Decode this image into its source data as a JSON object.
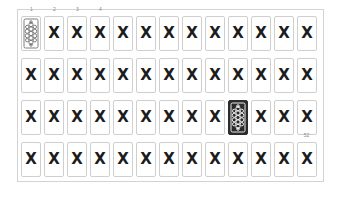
{
  "figure": {
    "name": "playing-card-deck-grid",
    "rows": 4,
    "columns": 13,
    "total_cards": 52,
    "colors": {
      "card_border": "#cfcfcf",
      "frame_border": "#d3d3d3",
      "mark_color": "#1c1c1c",
      "highlight_background": "#2b2b2b",
      "highlight_ornament": "#ffffff",
      "index_label_color": "#8a8a8a",
      "page_background": "#ffffff"
    },
    "mark_label": "X",
    "index_labels": {
      "1": "1",
      "2": "2",
      "3": "3",
      "4": "4",
      "52": "52"
    },
    "grid": [
      [
        {
          "index": 1,
          "state": "back",
          "label": "",
          "index_label": "1"
        },
        {
          "index": 2,
          "state": "marked",
          "label": "X",
          "index_label": "2"
        },
        {
          "index": 3,
          "state": "marked",
          "label": "X",
          "index_label": "3"
        },
        {
          "index": 4,
          "state": "marked",
          "label": "X",
          "index_label": "4"
        },
        {
          "index": 5,
          "state": "marked",
          "label": "X",
          "index_label": ""
        },
        {
          "index": 6,
          "state": "marked",
          "label": "X",
          "index_label": ""
        },
        {
          "index": 7,
          "state": "marked",
          "label": "X",
          "index_label": ""
        },
        {
          "index": 8,
          "state": "marked",
          "label": "X",
          "index_label": ""
        },
        {
          "index": 9,
          "state": "marked",
          "label": "X",
          "index_label": ""
        },
        {
          "index": 10,
          "state": "marked",
          "label": "X",
          "index_label": ""
        },
        {
          "index": 11,
          "state": "marked",
          "label": "X",
          "index_label": ""
        },
        {
          "index": 12,
          "state": "marked",
          "label": "X",
          "index_label": ""
        },
        {
          "index": 13,
          "state": "marked",
          "label": "X",
          "index_label": ""
        }
      ],
      [
        {
          "index": 14,
          "state": "marked",
          "label": "X",
          "index_label": ""
        },
        {
          "index": 15,
          "state": "marked",
          "label": "X",
          "index_label": ""
        },
        {
          "index": 16,
          "state": "marked",
          "label": "X",
          "index_label": ""
        },
        {
          "index": 17,
          "state": "marked",
          "label": "X",
          "index_label": ""
        },
        {
          "index": 18,
          "state": "marked",
          "label": "X",
          "index_label": ""
        },
        {
          "index": 19,
          "state": "marked",
          "label": "X",
          "index_label": ""
        },
        {
          "index": 20,
          "state": "marked",
          "label": "X",
          "index_label": ""
        },
        {
          "index": 21,
          "state": "marked",
          "label": "X",
          "index_label": ""
        },
        {
          "index": 22,
          "state": "marked",
          "label": "X",
          "index_label": ""
        },
        {
          "index": 23,
          "state": "marked",
          "label": "X",
          "index_label": ""
        },
        {
          "index": 24,
          "state": "marked",
          "label": "X",
          "index_label": ""
        },
        {
          "index": 25,
          "state": "marked",
          "label": "X",
          "index_label": ""
        },
        {
          "index": 26,
          "state": "marked",
          "label": "X",
          "index_label": ""
        }
      ],
      [
        {
          "index": 27,
          "state": "marked",
          "label": "X",
          "index_label": ""
        },
        {
          "index": 28,
          "state": "marked",
          "label": "X",
          "index_label": ""
        },
        {
          "index": 29,
          "state": "marked",
          "label": "X",
          "index_label": ""
        },
        {
          "index": 30,
          "state": "marked",
          "label": "X",
          "index_label": ""
        },
        {
          "index": 31,
          "state": "marked",
          "label": "X",
          "index_label": ""
        },
        {
          "index": 32,
          "state": "marked",
          "label": "X",
          "index_label": ""
        },
        {
          "index": 33,
          "state": "marked",
          "label": "X",
          "index_label": ""
        },
        {
          "index": 34,
          "state": "marked",
          "label": "X",
          "index_label": ""
        },
        {
          "index": 35,
          "state": "marked",
          "label": "X",
          "index_label": ""
        },
        {
          "index": 36,
          "state": "highlight",
          "label": "",
          "index_label": ""
        },
        {
          "index": 37,
          "state": "marked",
          "label": "X",
          "index_label": ""
        },
        {
          "index": 38,
          "state": "marked",
          "label": "X",
          "index_label": ""
        },
        {
          "index": 39,
          "state": "marked",
          "label": "X",
          "index_label": ""
        }
      ],
      [
        {
          "index": 40,
          "state": "marked",
          "label": "X",
          "index_label": ""
        },
        {
          "index": 41,
          "state": "marked",
          "label": "X",
          "index_label": ""
        },
        {
          "index": 42,
          "state": "marked",
          "label": "X",
          "index_label": ""
        },
        {
          "index": 43,
          "state": "marked",
          "label": "X",
          "index_label": ""
        },
        {
          "index": 44,
          "state": "marked",
          "label": "X",
          "index_label": ""
        },
        {
          "index": 45,
          "state": "marked",
          "label": "X",
          "index_label": ""
        },
        {
          "index": 46,
          "state": "marked",
          "label": "X",
          "index_label": ""
        },
        {
          "index": 47,
          "state": "marked",
          "label": "X",
          "index_label": ""
        },
        {
          "index": 48,
          "state": "marked",
          "label": "X",
          "index_label": ""
        },
        {
          "index": 49,
          "state": "marked",
          "label": "X",
          "index_label": ""
        },
        {
          "index": 50,
          "state": "marked",
          "label": "X",
          "index_label": ""
        },
        {
          "index": 51,
          "state": "marked",
          "label": "X",
          "index_label": ""
        },
        {
          "index": 52,
          "state": "marked",
          "label": "X",
          "index_label": "52"
        }
      ]
    ]
  }
}
